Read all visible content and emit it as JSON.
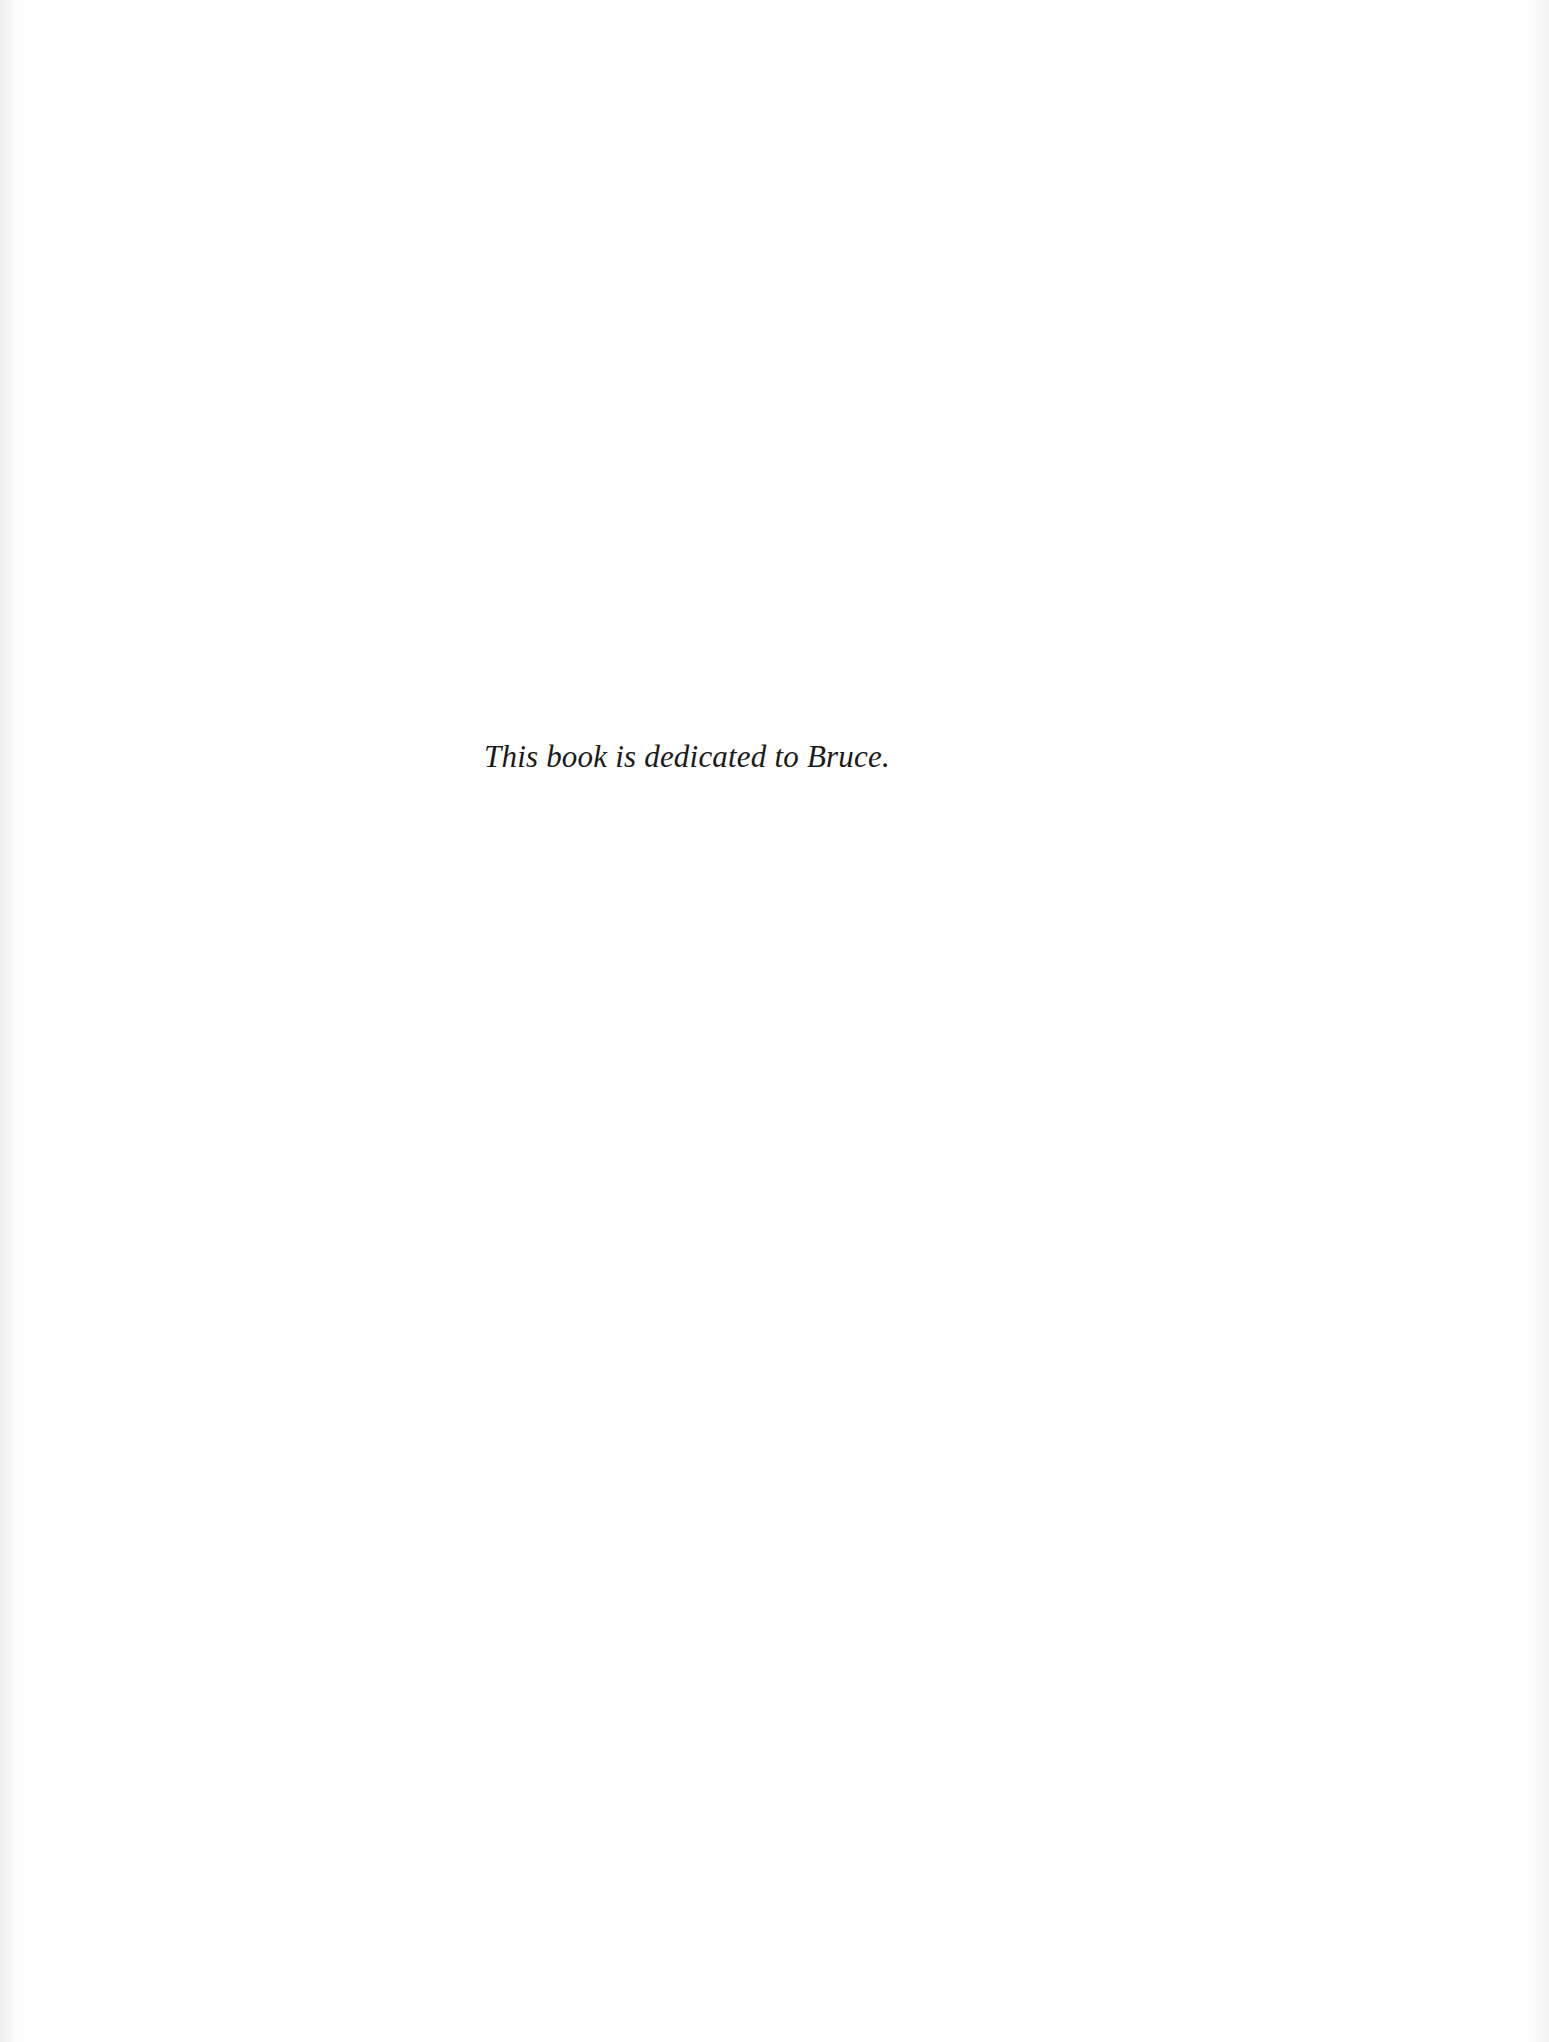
{
  "page": {
    "background_color": "#fefefe",
    "text_color": "#1a1a1a"
  },
  "dedication": {
    "text": "This book is dedicated to Bruce."
  }
}
